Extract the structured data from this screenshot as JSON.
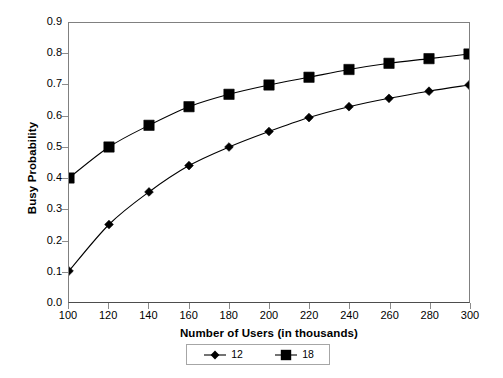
{
  "chart_data": {
    "type": "line",
    "title": "",
    "xlabel": "Number of Users (in thousands)",
    "ylabel": "Busy Probability",
    "x": [
      100,
      120,
      140,
      160,
      180,
      200,
      220,
      240,
      260,
      280,
      300
    ],
    "xtick_labels": [
      "100",
      "120",
      "140",
      "160",
      "180",
      "200",
      "220",
      "240",
      "260",
      "280",
      "300"
    ],
    "ytick_labels": [
      "0.9",
      "0.8",
      "0.7",
      "0.6",
      "0.5",
      "0.4",
      "0.3",
      "0.2",
      "0.1",
      "0.0"
    ],
    "ytick_values": [
      0.9,
      0.8,
      0.7,
      0.6,
      0.5,
      0.4,
      0.3,
      0.2,
      0.1,
      0.0
    ],
    "xlim": [
      100,
      300
    ],
    "ylim": [
      0.0,
      0.9
    ],
    "grid": false,
    "legend_position": "bottom",
    "series": [
      {
        "name": "12",
        "marker": "diamond",
        "color": "#000000",
        "values": [
          0.1,
          0.25,
          0.355,
          0.44,
          0.5,
          0.55,
          0.595,
          0.63,
          0.657,
          0.68,
          0.7
        ]
      },
      {
        "name": "18",
        "marker": "square",
        "color": "#000000",
        "values": [
          0.4,
          0.5,
          0.57,
          0.63,
          0.67,
          0.7,
          0.725,
          0.75,
          0.77,
          0.785,
          0.8
        ]
      }
    ]
  },
  "legend": {
    "entries": [
      {
        "label": "12",
        "marker": "diamond"
      },
      {
        "label": "18",
        "marker": "square"
      }
    ]
  },
  "colors": {
    "series": "#000000",
    "axis": "#808080",
    "background": "#ffffff"
  }
}
